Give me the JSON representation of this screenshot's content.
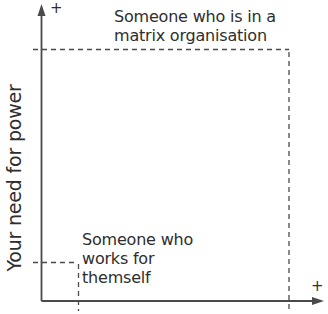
{
  "diagram": {
    "y_axis": {
      "label": "Your need for power",
      "end_marker": "+"
    },
    "x_axis": {
      "label": "",
      "end_marker": "+"
    },
    "points": [
      {
        "id": "matrix",
        "lines": [
          "Someone who is in a",
          "matrix organisation"
        ],
        "position": "high"
      },
      {
        "id": "self",
        "lines": [
          "Someone who",
          "works for",
          "themself"
        ],
        "position": "low"
      }
    ],
    "colors": {
      "axis": "#4a4a4a",
      "text": "#2e2e2e",
      "background": "#ffffff"
    }
  }
}
